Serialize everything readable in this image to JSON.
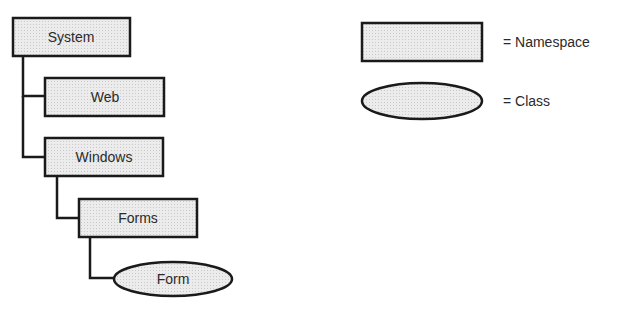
{
  "diagram": {
    "title": "",
    "colors": {
      "fill": "#e4e4e4",
      "stroke": "#1a1a1a",
      "text": "#2a2a2a"
    },
    "nodes": [
      {
        "id": "system",
        "label": "System",
        "shape": "rectangle",
        "type": "Namespace"
      },
      {
        "id": "web",
        "label": "Web",
        "shape": "rectangle",
        "type": "Namespace",
        "parent": "system"
      },
      {
        "id": "windows",
        "label": "Windows",
        "shape": "rectangle",
        "type": "Namespace",
        "parent": "system"
      },
      {
        "id": "forms",
        "label": "Forms",
        "shape": "rectangle",
        "type": "Namespace",
        "parent": "windows"
      },
      {
        "id": "form",
        "label": "Form",
        "shape": "ellipse",
        "type": "Class",
        "parent": "forms"
      }
    ],
    "edges": [
      {
        "from": "system",
        "to": "web"
      },
      {
        "from": "system",
        "to": "windows"
      },
      {
        "from": "windows",
        "to": "forms"
      },
      {
        "from": "forms",
        "to": "form"
      }
    ]
  },
  "legend": {
    "items": [
      {
        "shape": "rectangle",
        "label": "= Namespace"
      },
      {
        "shape": "ellipse",
        "label": "= Class"
      }
    ]
  }
}
